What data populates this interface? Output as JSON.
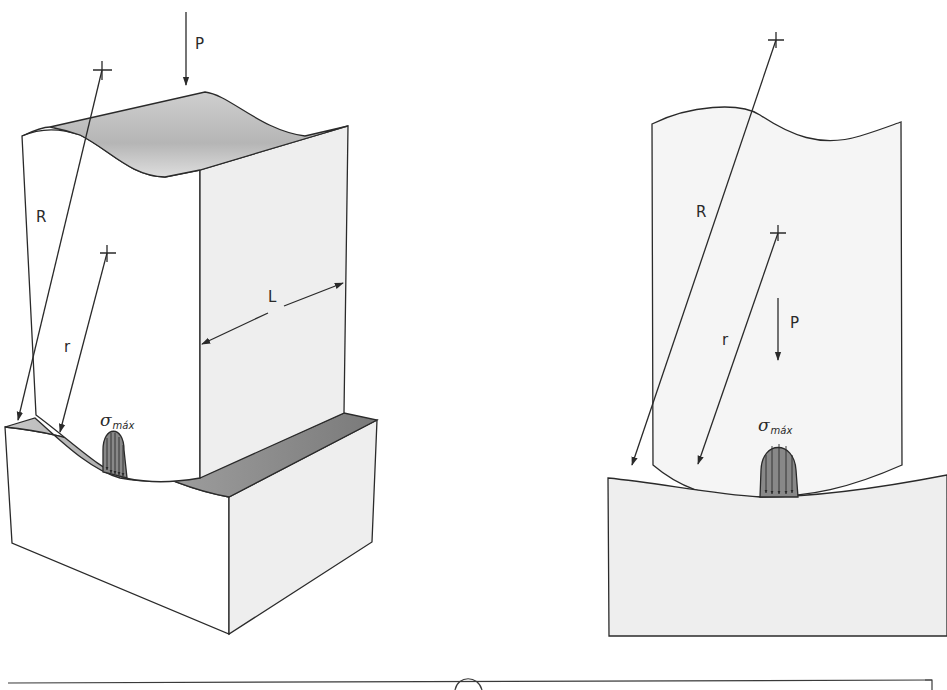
{
  "figure": {
    "left_view": {
      "description": "3D contact between a cylindrical body and a concave seat",
      "labels": {
        "load": "P",
        "outer_radius": "R",
        "inner_radius": "r",
        "length": "L",
        "stress_symbol": "σ",
        "stress_subscript": "máx"
      }
    },
    "right_view": {
      "description": "2D cross-section of contact",
      "labels": {
        "load": "P",
        "outer_radius": "R",
        "inner_radius": "r",
        "stress_symbol": "σ",
        "stress_subscript": "máx"
      }
    },
    "colors": {
      "line": "#2a2a2a",
      "face_light": "#eeeeee",
      "face_white": "#ffffff",
      "face_shaded": "#8c8c8c",
      "stress_fill": "#888888"
    }
  }
}
